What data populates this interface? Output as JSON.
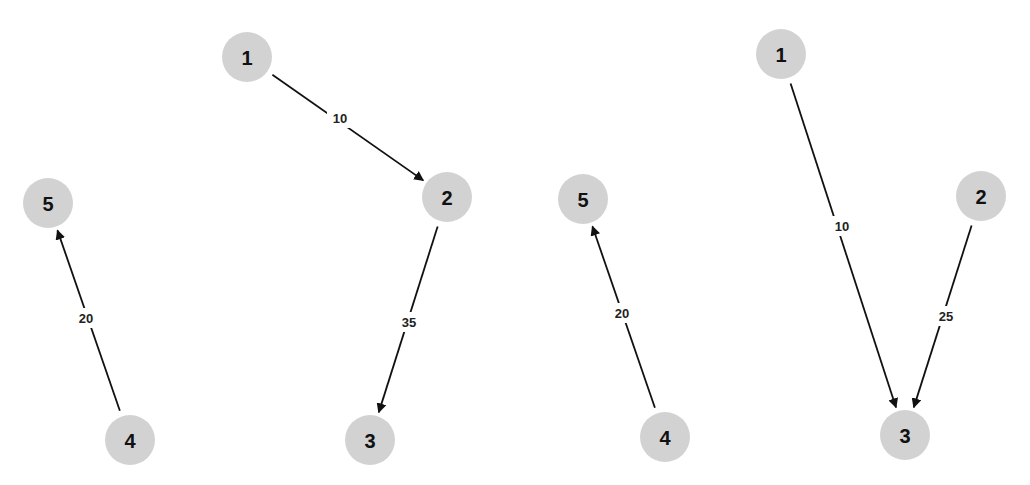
{
  "graphs": [
    {
      "name": "left-graph",
      "nodes": [
        {
          "id": "1",
          "label": "1",
          "x": 247,
          "y": 57
        },
        {
          "id": "2",
          "label": "2",
          "x": 447,
          "y": 197
        },
        {
          "id": "3",
          "label": "3",
          "x": 370,
          "y": 440
        },
        {
          "id": "4",
          "label": "4",
          "x": 130,
          "y": 440
        },
        {
          "id": "5",
          "label": "5",
          "x": 48,
          "y": 203
        }
      ],
      "edges": [
        {
          "from": "1",
          "to": "2",
          "weight": "10",
          "lx": 340,
          "ly": 118
        },
        {
          "from": "2",
          "to": "3",
          "weight": "35",
          "lx": 409,
          "ly": 322
        },
        {
          "from": "4",
          "to": "5",
          "weight": "20",
          "lx": 86,
          "ly": 318
        }
      ]
    },
    {
      "name": "right-graph",
      "nodes": [
        {
          "id": "1",
          "label": "1",
          "x": 781,
          "y": 54
        },
        {
          "id": "2",
          "label": "2",
          "x": 981,
          "y": 196
        },
        {
          "id": "3",
          "label": "3",
          "x": 905,
          "y": 435
        },
        {
          "id": "4",
          "label": "4",
          "x": 665,
          "y": 437
        },
        {
          "id": "5",
          "label": "5",
          "x": 583,
          "y": 199
        }
      ],
      "edges": [
        {
          "from": "1",
          "to": "3",
          "weight": "10",
          "lx": 842,
          "ly": 226
        },
        {
          "from": "2",
          "to": "3",
          "weight": "25",
          "lx": 946,
          "ly": 316
        },
        {
          "from": "4",
          "to": "5",
          "weight": "20",
          "lx": 622,
          "ly": 313
        }
      ]
    }
  ],
  "style": {
    "node_fill": "#d2d2d2",
    "node_radius": 25,
    "edge_color": "#111111",
    "background": "#ffffff"
  }
}
